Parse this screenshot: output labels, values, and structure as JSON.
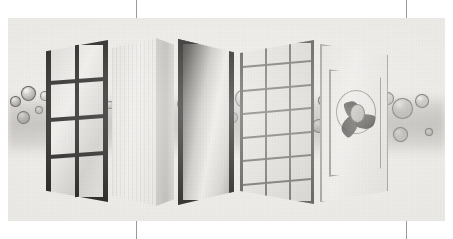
{
  "document": {
    "kind": "scanned-printed-page",
    "figure_caption": "",
    "visible_text": []
  },
  "crop_marks": {
    "description": "thin vertical registration/crop rules printed in the page margins",
    "color": "#9a9a9a",
    "top": [
      136,
      406
    ],
    "bottom": [
      136,
      406
    ]
  },
  "plate": {
    "background_color": "#eceae6",
    "ink_color": "#201f1d",
    "haze_color": "#8a8885",
    "x": 8,
    "y": 18,
    "width": 437,
    "height": 203
  },
  "figure": {
    "title": "",
    "layers": [
      {
        "index": 1,
        "name": "mullioned-window-frame",
        "label": "",
        "description": "dark painted window frame, two panes wide by four panes tall",
        "frame_color": "#201f1d",
        "glass_color": "#dedcd8",
        "columns": 2,
        "rows": 4
      },
      {
        "index": 2,
        "name": "solid-slab-panel",
        "label": "",
        "description": "opaque light slab shown with its edge thickness",
        "face_color": "#e9e7e2",
        "edge_color": "#c3c1bc"
      },
      {
        "index": 3,
        "name": "dark-framed-glazing",
        "label": "",
        "description": "single large pane in a dark frame with specular gradient",
        "frame_color": "#232220",
        "pane_color": "#cdcbc6"
      },
      {
        "index": 4,
        "name": "fine-mesh-screen",
        "label": "",
        "description": "open grid screen, three bays wide by seven courses tall",
        "line_color": "#76746f",
        "columns": 3,
        "rows": 7
      },
      {
        "index": 5,
        "name": "louvred-vent-panel",
        "label": "",
        "description": "light panel with an inset reveal and a circular fan / louvre at its centre",
        "face_color": "#e9e7e2",
        "reveal_color": "#9d9b96",
        "fan_color": "#504e4a"
      }
    ],
    "particles": {
      "name": "airborne-particles",
      "description": "clusters of translucent spheres drifting through the layers",
      "count": 34,
      "outline_color": "#52504c",
      "fill_color": "#b8b6b2",
      "items": [
        {
          "x": 14,
          "y": 100,
          "d": 9,
          "style": "solid"
        },
        {
          "x": 27,
          "y": 92,
          "d": 13,
          "style": "solid"
        },
        {
          "x": 22,
          "y": 116,
          "d": 11,
          "style": "solid"
        },
        {
          "x": 38,
          "y": 109,
          "d": 6,
          "style": "tiny"
        },
        {
          "x": 44,
          "y": 95,
          "d": 8,
          "style": "bubble"
        },
        {
          "x": 52,
          "y": 121,
          "d": 7,
          "style": "tiny"
        },
        {
          "x": 60,
          "y": 99,
          "d": 15,
          "style": "bubble"
        },
        {
          "x": 72,
          "y": 112,
          "d": 6,
          "style": "tiny"
        },
        {
          "x": 84,
          "y": 96,
          "d": 12,
          "style": "bubble"
        },
        {
          "x": 96,
          "y": 118,
          "d": 8,
          "style": "bubble"
        },
        {
          "x": 109,
          "y": 104,
          "d": 6,
          "style": "tiny"
        },
        {
          "x": 128,
          "y": 98,
          "d": 16,
          "style": "bubble"
        },
        {
          "x": 146,
          "y": 109,
          "d": 10,
          "style": "bubble"
        },
        {
          "x": 140,
          "y": 124,
          "d": 7,
          "style": "tiny"
        },
        {
          "x": 158,
          "y": 96,
          "d": 12,
          "style": "bubble"
        },
        {
          "x": 166,
          "y": 117,
          "d": 8,
          "style": "bubble"
        },
        {
          "x": 180,
          "y": 103,
          "d": 6,
          "style": "tiny"
        },
        {
          "x": 196,
          "y": 94,
          "d": 11,
          "style": "bubble"
        },
        {
          "x": 205,
          "y": 112,
          "d": 14,
          "style": "bubble"
        },
        {
          "x": 218,
          "y": 100,
          "d": 7,
          "style": "tiny"
        },
        {
          "x": 231,
          "y": 116,
          "d": 9,
          "style": "bubble"
        },
        {
          "x": 243,
          "y": 97,
          "d": 17,
          "style": "bubble"
        },
        {
          "x": 252,
          "y": 122,
          "d": 6,
          "style": "tiny"
        },
        {
          "x": 262,
          "y": 105,
          "d": 13,
          "style": "solid"
        },
        {
          "x": 276,
          "y": 96,
          "d": 11,
          "style": "solid"
        },
        {
          "x": 272,
          "y": 121,
          "d": 16,
          "style": "bubble"
        },
        {
          "x": 291,
          "y": 110,
          "d": 7,
          "style": "tiny"
        },
        {
          "x": 322,
          "y": 99,
          "d": 9,
          "style": "solid"
        },
        {
          "x": 318,
          "y": 125,
          "d": 12,
          "style": "solid"
        },
        {
          "x": 348,
          "y": 122,
          "d": 11,
          "style": "solid"
        },
        {
          "x": 386,
          "y": 97,
          "d": 11,
          "style": "bubble"
        },
        {
          "x": 401,
          "y": 107,
          "d": 19,
          "style": "bubble"
        },
        {
          "x": 421,
          "y": 100,
          "d": 12,
          "style": "bubble"
        },
        {
          "x": 399,
          "y": 133,
          "d": 13,
          "style": "bubble"
        },
        {
          "x": 428,
          "y": 131,
          "d": 6,
          "style": "tiny"
        }
      ]
    }
  }
}
